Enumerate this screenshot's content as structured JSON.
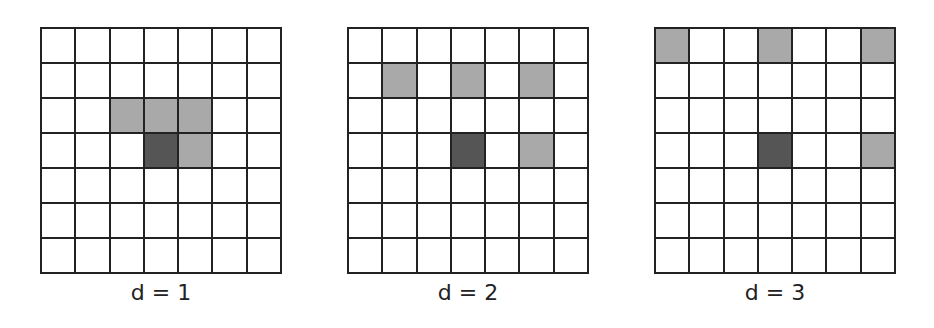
{
  "figure": {
    "colors": {
      "line": "#222222",
      "empty": "#ffffff",
      "neighbor": "#a9a9a9",
      "center": "#555555"
    },
    "grid_size": 7,
    "panels": [
      {
        "label": "d = 1",
        "left": 40,
        "center": [
          3,
          3
        ],
        "neighbors": [
          [
            2,
            2
          ],
          [
            2,
            3
          ],
          [
            2,
            4
          ],
          [
            3,
            4
          ]
        ]
      },
      {
        "label": "d = 2",
        "left": 347,
        "center": [
          3,
          3
        ],
        "neighbors": [
          [
            1,
            1
          ],
          [
            1,
            3
          ],
          [
            1,
            5
          ],
          [
            3,
            5
          ]
        ]
      },
      {
        "label": "d = 3",
        "left": 654,
        "center": [
          3,
          3
        ],
        "neighbors": [
          [
            0,
            0
          ],
          [
            0,
            3
          ],
          [
            0,
            6
          ],
          [
            3,
            6
          ]
        ]
      }
    ]
  }
}
